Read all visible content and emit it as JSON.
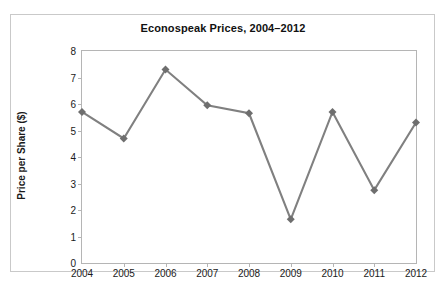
{
  "chart_data": {
    "type": "line",
    "title": "Econospeak Prices, 2004–2012",
    "xlabel": "",
    "ylabel": "Price per Share ($)",
    "categories": [
      "2004",
      "2005",
      "2006",
      "2007",
      "2008",
      "2009",
      "2010",
      "2011",
      "2012"
    ],
    "x": [
      2004,
      2005,
      2006,
      2007,
      2008,
      2009,
      2010,
      2011,
      2012
    ],
    "values": [
      5.7,
      4.7,
      7.3,
      5.95,
      5.65,
      1.65,
      5.7,
      2.75,
      5.3
    ],
    "series": [
      {
        "name": "Price per Share ($)",
        "values": [
          5.7,
          4.7,
          7.3,
          5.95,
          5.65,
          1.65,
          5.7,
          2.75,
          5.3
        ]
      }
    ],
    "ylim": [
      0,
      8
    ],
    "yticks": [
      0,
      1,
      2,
      3,
      4,
      5,
      6,
      7,
      8
    ],
    "ytick_labels": [
      "0",
      "1",
      "2",
      "3",
      "4",
      "5",
      "6",
      "7",
      "8"
    ],
    "xtick_labels": [
      "2004",
      "2005",
      "2006",
      "2007",
      "2008",
      "2009",
      "2010",
      "2011",
      "2012"
    ],
    "grid": false,
    "legend": false,
    "legend_position": "none",
    "line_color": "#808080",
    "marker_color": "#6e6e6e",
    "marker_shape": "diamond",
    "plot_background": "#ffffff",
    "axis_color": "#b5b5b5",
    "frame_color": "#c9c9c9",
    "title_color": "#111111"
  }
}
